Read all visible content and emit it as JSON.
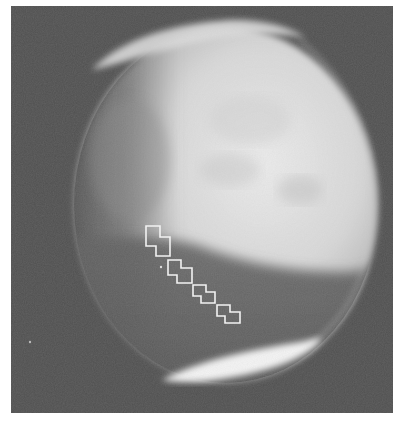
{
  "image": {
    "subject": "Mars disk, grayscale",
    "frame": {
      "x": 11,
      "y": 6,
      "width": 382,
      "height": 407
    },
    "colors": {
      "page_background": "#ffffff",
      "sky_background": "#4f4f4f",
      "bright_surface": "#e2e2e2",
      "mid_surface": "#b5b5b5",
      "dark_region": "#5e5e5e",
      "polar_cap": "#f4f4f4",
      "footprint_outline": "#f2f2f2"
    },
    "planet": {
      "cx": 222,
      "cy": 208,
      "r": 156
    },
    "polar_caps": [
      {
        "name": "north-polar-hood",
        "position": "top"
      },
      {
        "name": "south-polar-cap",
        "position": "bottom"
      }
    ],
    "footprints": [
      {
        "id": 1,
        "points": "146,226 160,226 160,237 170,237 170,256 156,256 156,246 146,246"
      },
      {
        "id": 2,
        "points": "168,260 181,260 181,268 192,268 192,283 177,283 177,275 168,275"
      },
      {
        "id": 3,
        "points": "193,285 206,285 206,292 215,292 215,303 201,303 201,296 193,296"
      },
      {
        "id": 4,
        "points": "217,305 230,305 230,312 240,312 240,323 225,323 225,316 217,316"
      }
    ],
    "markers": [
      {
        "x": 161,
        "y": 267
      },
      {
        "x": 30,
        "y": 342
      }
    ]
  }
}
